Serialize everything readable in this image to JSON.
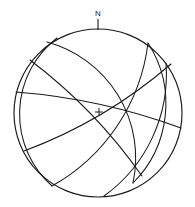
{
  "figure": {
    "kind": "stereonet",
    "title": "",
    "background_color": "#ffffff",
    "line_color": "#1a1a1a"
  },
  "labels": {
    "north": "N"
  },
  "chart_data": {
    "type": "scatter",
    "projection": "equal-angle stereographic (Wulff) lower hemisphere",
    "title": "",
    "xlabel": "",
    "ylabel": "",
    "grid": false,
    "legend": null,
    "annotations": [
      "N"
    ],
    "primitive_circle": {
      "center_x": 98,
      "center_y": 113,
      "radius": 84
    },
    "north_marker": {
      "label": "N",
      "label_x": 98,
      "label_y": 14,
      "tick_x": 98,
      "tick_y1": 19,
      "tick_y2": 30
    },
    "center_marker": {
      "x": 99,
      "y": 112,
      "size": 4
    },
    "great_circles": [
      {
        "name": "gc-1",
        "start_x": 47,
        "start_y": 42,
        "end_x": 133,
        "end_y": 183,
        "rx": 120,
        "ry": 120,
        "sweep": 1,
        "large_arc": 0
      },
      {
        "name": "gc-2",
        "start_x": 57,
        "start_y": 38,
        "end_x": 52,
        "end_y": 186,
        "rx": 96,
        "ry": 96,
        "sweep": 0,
        "large_arc": 0
      },
      {
        "name": "gc-3",
        "start_x": 148,
        "start_y": 43,
        "end_x": 52,
        "end_y": 186,
        "rx": 190,
        "ry": 190,
        "sweep": 1,
        "large_arc": 0
      },
      {
        "name": "gc-4",
        "start_x": 148,
        "start_y": 43,
        "end_x": 133,
        "end_y": 183,
        "rx": 112,
        "ry": 112,
        "sweep": 1,
        "large_arc": 0
      },
      {
        "name": "gc-5",
        "start_x": 166,
        "start_y": 63,
        "end_x": 104,
        "end_y": 196,
        "rx": 150,
        "ry": 150,
        "sweep": 1,
        "large_arc": 0
      },
      {
        "name": "gc-6",
        "start_x": 16,
        "start_y": 92,
        "end_x": 181,
        "end_y": 128,
        "rx": 620,
        "ry": 620,
        "sweep": 1,
        "large_arc": 0
      },
      {
        "name": "gc-7",
        "start_x": 30,
        "start_y": 60,
        "end_x": 142,
        "end_y": 176,
        "rx": 520,
        "ry": 520,
        "sweep": 1,
        "large_arc": 0
      },
      {
        "name": "gc-8",
        "start_x": 24,
        "start_y": 151,
        "end_x": 171,
        "end_y": 64,
        "rx": 480,
        "ry": 480,
        "sweep": 0,
        "large_arc": 0
      }
    ]
  }
}
